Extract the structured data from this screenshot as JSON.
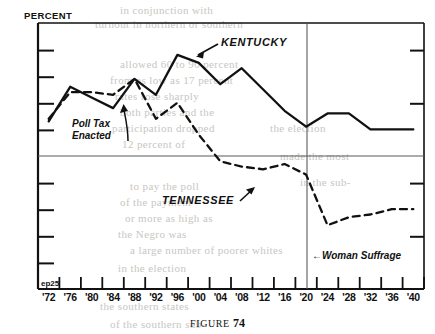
{
  "figure": {
    "caption_label": "FIGURE",
    "caption_number": "74",
    "corner_code": "ep25"
  },
  "chart_data": {
    "type": "line",
    "title": "",
    "ylabel": "PERCENT",
    "xlabel": "",
    "ylim": [
      0,
      100
    ],
    "yticks": [
      0,
      10,
      20,
      30,
      40,
      50,
      60,
      70,
      80,
      90,
      100
    ],
    "ytick_labels": [
      "0",
      "IO",
      "20",
      "30",
      "40",
      "50",
      "60",
      "70",
      "80",
      "90",
      "IOO"
    ],
    "grid": "horizontal line at 50 only",
    "xlim": [
      1870,
      1942
    ],
    "x": [
      1872,
      1876,
      1880,
      1884,
      1888,
      1892,
      1896,
      1900,
      1904,
      1908,
      1912,
      1916,
      1920,
      1924,
      1928,
      1932,
      1936,
      1940
    ],
    "xtick_labels": [
      "'72",
      "'76",
      "'80",
      "'84",
      "'88",
      "'92",
      "'96",
      "'00",
      "'04",
      "'08",
      "'12",
      "'16",
      "'20",
      "'24",
      "'28",
      "'32",
      "'36",
      "'40"
    ],
    "legend_position": "inline annotations on curves",
    "series": [
      {
        "name": "KENTUCKY",
        "style": "solid",
        "values": [
          63,
          76,
          72,
          68,
          79,
          73,
          88,
          85,
          77,
          83,
          75,
          67,
          61,
          66,
          66,
          60,
          60,
          60
        ]
      },
      {
        "name": "TENNESSEE",
        "style": "dashed",
        "values": [
          64,
          74,
          74,
          73,
          79,
          64,
          70,
          58,
          48,
          46,
          45,
          47,
          43,
          24,
          27,
          28,
          30,
          30
        ]
      }
    ],
    "annotations": [
      {
        "name": "poll-tax-enacted",
        "text_line1": "Poll Tax",
        "text_line2": "Enacted",
        "points_to_year": 1894,
        "points_to_series": "TENNESSEE"
      },
      {
        "name": "woman-suffrage",
        "text": "Woman Suffrage",
        "arrow": "←",
        "marks_year": 1920
      },
      {
        "name": "kentucky-label",
        "text": "KENTUCKY"
      },
      {
        "name": "tennessee-label",
        "text": "TENNESSEE"
      }
    ],
    "reference_lines": [
      {
        "name": "suffrage-vertical-line",
        "orientation": "vertical",
        "value": 1920
      },
      {
        "name": "fifty-percent-line",
        "orientation": "horizontal",
        "value": 50
      }
    ]
  },
  "bleed_text": {
    "lines": [
      "the vote",
      "in the old",
      "in northern or southern",
      "allowed 60 to 90 percent",
      "from as low as 17 percent",
      "rates rose sharply",
      "both parties and the",
      "participation dropped",
      "12 percent of",
      "There was",
      "to pay the poll",
      "of the payment",
      "or more as high as",
      "the Negro was",
      "and such as",
      "a large number of poorer whites",
      "in the election",
      "made the most",
      "in the southern sub-"
    ]
  }
}
